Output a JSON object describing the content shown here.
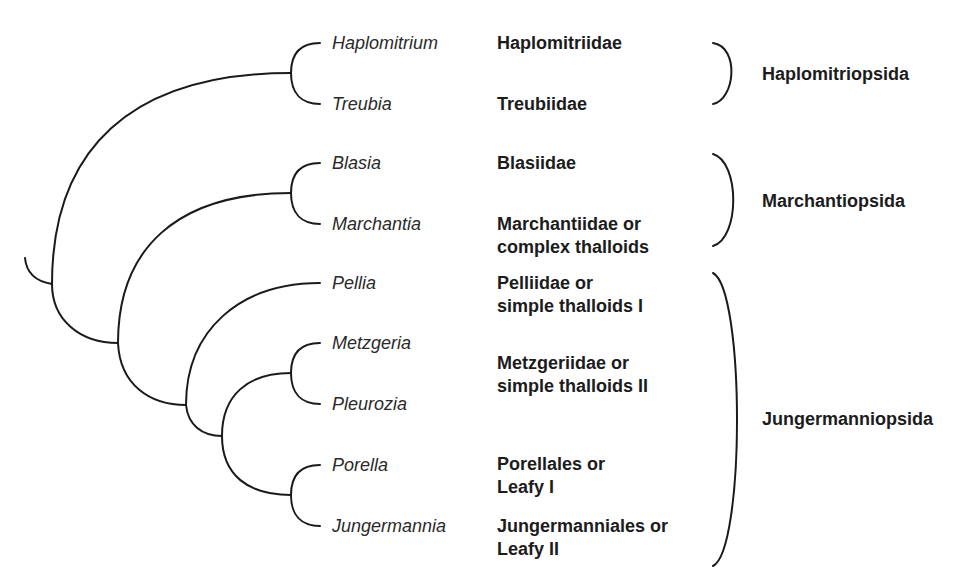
{
  "diagram": {
    "type": "cladogram",
    "line_color": "#1a1a1a",
    "text_color": "#1c1c1c"
  },
  "genera": [
    {
      "id": "haplomitrium",
      "label": "Haplomitrium"
    },
    {
      "id": "treubia",
      "label": "Treubia"
    },
    {
      "id": "blasia",
      "label": "Blasia"
    },
    {
      "id": "marchantia",
      "label": "Marchantia"
    },
    {
      "id": "pellia",
      "label": "Pellia"
    },
    {
      "id": "metzgeria",
      "label": "Metzgeria"
    },
    {
      "id": "pleurozia",
      "label": "Pleurozia"
    },
    {
      "id": "porella",
      "label": "Porella"
    },
    {
      "id": "jungermannia",
      "label": "Jungermannia"
    }
  ],
  "subclasses": [
    {
      "id": "haplomitriidae",
      "lines": [
        "Haplomitriidae"
      ]
    },
    {
      "id": "treubiidae",
      "lines": [
        "Treubiidae"
      ]
    },
    {
      "id": "blasiidae",
      "lines": [
        "Blasiidae"
      ]
    },
    {
      "id": "marchantiidae",
      "lines": [
        "Marchantiidae or",
        "complex thalloids"
      ]
    },
    {
      "id": "pelliidae",
      "lines": [
        "Pelliidae or",
        "simple thalloids I"
      ]
    },
    {
      "id": "metzgeriidae",
      "lines": [
        "Metzgeriidae or",
        "simple thalloids II"
      ]
    },
    {
      "id": "porellales",
      "lines": [
        "Porellales or",
        "Leafy I"
      ]
    },
    {
      "id": "jungermanniales",
      "lines": [
        "Jungermanniales or",
        "Leafy II"
      ]
    }
  ],
  "classes": [
    {
      "id": "haplomitriopsida",
      "label": "Haplomitriopsida",
      "members": [
        "Haplomitriidae",
        "Treubiidae"
      ]
    },
    {
      "id": "marchantiopsida",
      "label": "Marchantiopsida",
      "members": [
        "Blasiidae",
        "Marchantiidae"
      ]
    },
    {
      "id": "jungermanniopsida",
      "label": "Jungermanniopsida",
      "members": [
        "Pelliidae",
        "Metzgeriidae",
        "Porellales",
        "Jungermanniales"
      ]
    }
  ],
  "topology": "((Haplomitrium,Treubia),((Blasia,Marchantia),(Pellia,((Metzgeria,Pleurozia),(Porella,Jungermannia)))))"
}
